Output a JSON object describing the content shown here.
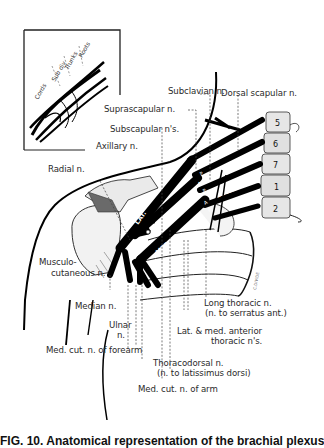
{
  "figure": {
    "caption_partial": "FIG. 10. Anatomical representation of the brachial plexus"
  },
  "inset": {
    "labels": [
      "Cords",
      "Sub div",
      "Trunks",
      "Roots"
    ]
  },
  "trunks": {
    "upper": "UPPER",
    "middle": "MIDDLE",
    "lower": "LOWER"
  },
  "cords": {
    "lateral": "LAT.",
    "posterior": "POST.",
    "medial": "MED."
  },
  "division_marks": [
    "A",
    "P",
    "A",
    "P",
    "A",
    "P"
  ],
  "vertebrae": [
    "5",
    "6",
    "7",
    "1",
    "2"
  ],
  "rib_mark": "C.DIVIDE",
  "nerves": {
    "subclavian": "Subclavian n.",
    "dorsal_scapular": "Dorsal scapular n.",
    "suprascapular": "Suprascapular n.",
    "subscapular": "Subscapular n's.",
    "axillary": "Axillary n.",
    "radial": "Radial n.",
    "musculocutaneous_1": "Musculo-",
    "musculocutaneous_2": "cutaneous n.",
    "median": "Median n.",
    "ulnar_1": "Ulnar",
    "ulnar_2": "n.",
    "med_cut_forearm": "Med. cut. n. of forearm",
    "med_cut_arm": "Med. cut. n. of arm",
    "thoracodorsal_1": "Thoracodorsal n.",
    "thoracodorsal_2": "(n. to latissimus dorsi)",
    "lat_med_ant_thoracic_1": "Lat. & med. anterior",
    "lat_med_ant_thoracic_2": "thoracic n's.",
    "long_thoracic_1": "Long thoracic  n.",
    "long_thoracic_2": "(n. to serratus ant.)"
  }
}
